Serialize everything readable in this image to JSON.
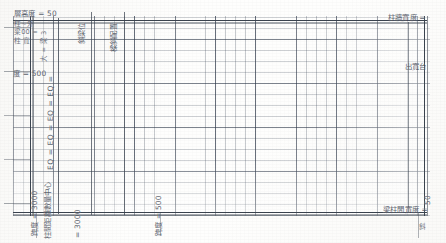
{
  "document": {
    "kind": "scanned-grid-drawing",
    "colors": {
      "ink": "#3a4250",
      "grid_minor": "#46505f",
      "grid_major": "#2d3748",
      "paper": "#fefefd"
    }
  },
  "annotations": {
    "top_left_dimension": "層高度 = 50",
    "left_upper_stack_1": "柱~外",
    "left_upper_stack_2": "梁00 =",
    "left_upper_stack_3": "柱 寬",
    "left_upper_stack_4": "大 = 梁 3",
    "left_mid_dimension": "度 = 500",
    "left_eq_chain": "EQ = EQ = EQ = EQ =",
    "left_lower_vertical_1": "跨度 = 3000",
    "left_lower_vertical_2": "柱間距離數量中心",
    "left_lower_vertical_3": "= 3000",
    "top_mid_vertical_1": "斜梁位",
    "top_mid_vertical_2": "樑斜配置",
    "bottom_mid_vertical": "跨度 = 500",
    "right_top_label": "柱牆寬度 =",
    "right_mid_label": "出寬台",
    "right_bottom_label": "梁柱間寬度 =",
    "right_bottom_num": "50",
    "bottom_right_mark": "斜"
  },
  "grid": {
    "minor_spacing_x_px": 10,
    "minor_spacing_y_px": 11,
    "major_every_cells": 4,
    "origin": {
      "x": 13,
      "y": 16
    },
    "size": {
      "width": 417,
      "height": 200
    }
  }
}
